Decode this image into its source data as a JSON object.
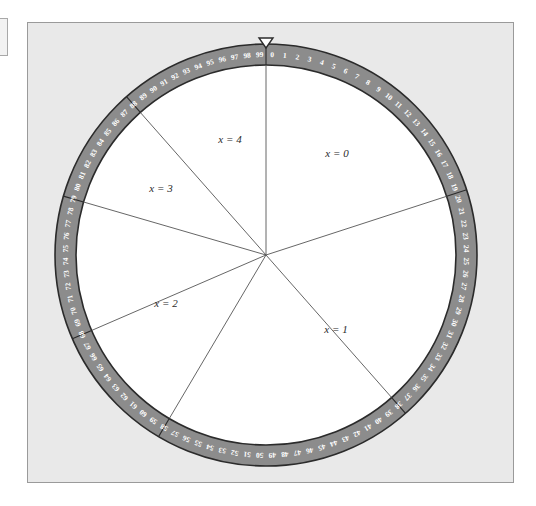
{
  "figure": {
    "type": "probability-wheel",
    "panel": {
      "background_color": "#e9e9e9",
      "border_color": "#9a9a9a"
    },
    "rim": {
      "fill_color": "#8c8c8c",
      "stroke_color": "#2b2b2b",
      "tick_text_color": "#ffffff",
      "tick_count": 100,
      "tick_start": 0,
      "tick_end": 99,
      "direction": "clockwise",
      "zero_position": "top",
      "tick_labels": [
        "0",
        "1",
        "2",
        "3",
        "4",
        "5",
        "6",
        "7",
        "8",
        "9",
        "10",
        "11",
        "12",
        "13",
        "14",
        "15",
        "16",
        "17",
        "18",
        "19",
        "20",
        "21",
        "22",
        "23",
        "24",
        "25",
        "26",
        "27",
        "28",
        "29",
        "30",
        "31",
        "32",
        "33",
        "34",
        "35",
        "36",
        "37",
        "38",
        "39",
        "40",
        "41",
        "42",
        "43",
        "44",
        "45",
        "46",
        "47",
        "48",
        "49",
        "50",
        "51",
        "52",
        "53",
        "54",
        "55",
        "56",
        "57",
        "58",
        "59",
        "60",
        "61",
        "62",
        "63",
        "64",
        "65",
        "66",
        "67",
        "68",
        "69",
        "70",
        "71",
        "72",
        "73",
        "74",
        "75",
        "76",
        "77",
        "78",
        "79",
        "80",
        "81",
        "82",
        "83",
        "84",
        "85",
        "86",
        "87",
        "88",
        "89",
        "90",
        "91",
        "92",
        "93",
        "94",
        "95",
        "96",
        "97",
        "98",
        "99"
      ]
    },
    "pointer": {
      "name": "pointer-marker",
      "shape": "downward-triangle",
      "fill_color": "#ffffff",
      "stroke_color": "#2b2b2b",
      "position": "top",
      "points_at": 0
    },
    "center": {
      "x": 266,
      "y": 255
    },
    "inner_fill_color": "#ffffff",
    "spoke_color": "#555555"
  },
  "chart_data": {
    "type": "pie",
    "title": "",
    "xlabel": "",
    "ylabel": "",
    "legend_position": "inside-sectors",
    "grid": false,
    "units": "percent of wheel (0-99 graduations)",
    "categories": [
      "x = 0",
      "x = 1",
      "x = 2",
      "x = 3",
      "x = 4"
    ],
    "values": [
      20,
      18.5,
      21,
      9,
      11.5
    ],
    "sectors": [
      {
        "label": "x = 0",
        "start_tick": 0,
        "end_tick": 20,
        "span_ticks": 20,
        "label_x": 337,
        "label_y": 157
      },
      {
        "label": "x = 1",
        "start_tick": 20,
        "end_tick": 38.5,
        "span_ticks": 18.5,
        "label_x": 336,
        "label_y": 333
      },
      {
        "label": "x = 2",
        "start_tick": 38.5,
        "end_tick": 59.5,
        "span_ticks": 21,
        "label_x": 166,
        "label_y": 307
      },
      {
        "label": "x = 3",
        "start_tick": 59.5,
        "end_tick": 68.5,
        "span_ticks": 9,
        "label_x": 161,
        "label_y": 192
      },
      {
        "label": "x = 4",
        "start_tick": 68.5,
        "end_tick": 80,
        "span_ticks": 11.5,
        "label_x": 230,
        "label_y": 143
      }
    ],
    "boundary_ticks": [
      0,
      20,
      38.5,
      58.5,
      68.5,
      79.5,
      88.5
    ]
  }
}
